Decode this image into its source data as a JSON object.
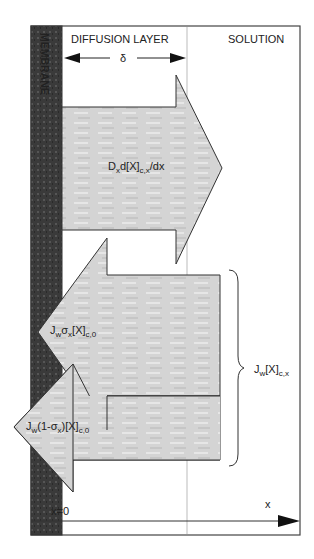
{
  "regions": {
    "membrane": "MEMBRANE",
    "diffusion_layer": "DIFFUSION LAYER",
    "solution": "SOLUTION"
  },
  "thickness_symbol": "δ",
  "arrows": [
    {
      "id": "diffusive-flux",
      "direction": "right",
      "label_main": "D",
      "label_sub1": "x",
      "label_mid": "d[X]",
      "label_sub2": "c,x",
      "label_tail": "/dx"
    },
    {
      "id": "reflected-flux",
      "direction": "left",
      "label_main": "J",
      "label_sub1": "w",
      "label_mid": "σ",
      "label_sub2": "x",
      "label_tail": "[X]",
      "label_sub3": "c,0"
    },
    {
      "id": "transmitted-flux",
      "direction": "left",
      "label_main": "J",
      "label_sub1": "w",
      "label_mid": "(1-σ",
      "label_sub2": "x",
      "label_tail": ")[X]",
      "label_sub3": "c,0"
    }
  ],
  "brace_label": {
    "main": "J",
    "sub1": "w",
    "mid": "[X]",
    "sub2": "c,x"
  },
  "axis": {
    "origin_label": "x=0",
    "axis_label": "x"
  },
  "colors": {
    "membrane": "#3a3a3a",
    "arrow_fill": "#d6d6d6",
    "stroke": "#333333",
    "divider": "#999999"
  }
}
